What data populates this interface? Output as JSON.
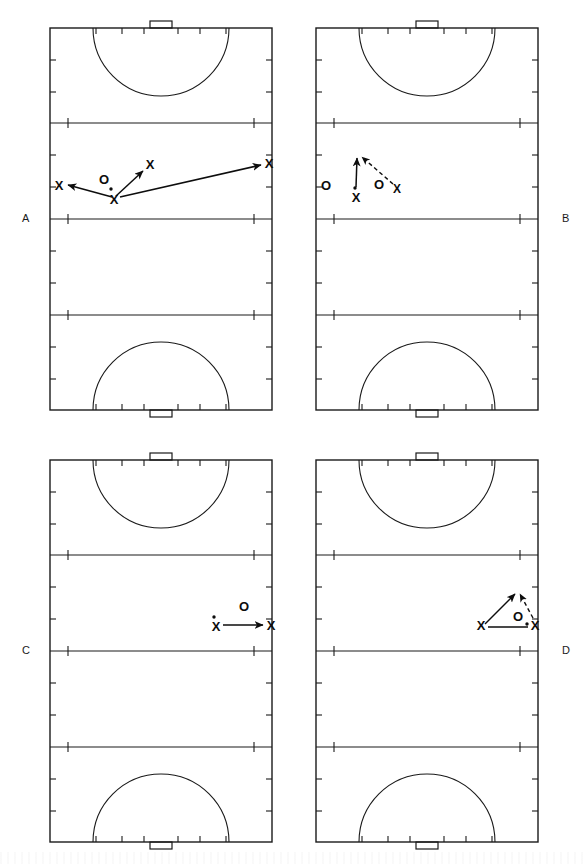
{
  "figure": {
    "panels": [
      {
        "id": "A",
        "label": "A",
        "label_side": "left",
        "markers": [
          {
            "name": "ball-carrier-x",
            "symbol": "X",
            "x": 114,
            "y": 200,
            "has_ball": true
          },
          {
            "name": "defender-o",
            "symbol": "O",
            "x": 104,
            "y": 182,
            "has_ball": false
          },
          {
            "name": "teammate-x-left",
            "symbol": "X",
            "x": 59,
            "y": 187,
            "has_ball": false
          },
          {
            "name": "teammate-x-upper",
            "symbol": "X",
            "x": 149,
            "y": 166,
            "has_ball": false
          },
          {
            "name": "teammate-x-right",
            "symbol": "X",
            "x": 269,
            "y": 165,
            "has_ball": false
          }
        ],
        "arrows": [
          {
            "name": "pass-left",
            "style": "solid",
            "x1": 112,
            "y1": 197,
            "x2": 66,
            "y2": 185
          },
          {
            "name": "pass-upper",
            "style": "solid",
            "x1": 116,
            "y1": 196,
            "x2": 142,
            "y2": 170
          },
          {
            "name": "pass-right",
            "style": "solid",
            "x1": 120,
            "y1": 197,
            "x2": 262,
            "y2": 165
          }
        ]
      },
      {
        "id": "B",
        "label": "B",
        "label_side": "right",
        "markers": [
          {
            "name": "wing-o-left",
            "symbol": "O",
            "x": 32,
            "y": 187,
            "has_ball": false
          },
          {
            "name": "ball-carrier-x",
            "symbol": "X",
            "x": 62,
            "y": 196,
            "has_ball": true
          },
          {
            "name": "defender-o",
            "symbol": "O",
            "x": 85,
            "y": 186,
            "has_ball": false
          },
          {
            "name": "teammate-x-right",
            "symbol": "X",
            "x": 102,
            "y": 190,
            "has_ball": false
          }
        ],
        "arrows": [
          {
            "name": "run-up",
            "style": "solid",
            "x1": 62,
            "y1": 186,
            "x2": 64,
            "y2": 155
          },
          {
            "name": "pass-diagonal",
            "style": "dashed",
            "x1": 98,
            "y1": 184,
            "x2": 68,
            "y2": 155
          }
        ]
      },
      {
        "id": "C",
        "label": "C",
        "label_side": "left",
        "markers": [
          {
            "name": "ball-carrier-x",
            "symbol": "X",
            "x": 216,
            "y": 196,
            "has_ball": true
          },
          {
            "name": "defender-o",
            "symbol": "O",
            "x": 244,
            "y": 176,
            "has_ball": false
          },
          {
            "name": "teammate-x-right",
            "symbol": "X",
            "x": 271,
            "y": 195,
            "has_ball": false
          }
        ],
        "arrows": [
          {
            "name": "pass-across",
            "style": "solid",
            "x1": 224,
            "y1": 193,
            "x2": 264,
            "y2": 193
          }
        ]
      },
      {
        "id": "D",
        "label": "D",
        "label_side": "right",
        "markers": [
          {
            "name": "teammate-x-left",
            "symbol": "X",
            "x": 216,
            "y": 197,
            "has_ball": false
          },
          {
            "name": "defender-o",
            "symbol": "O",
            "x": 252,
            "y": 186,
            "has_ball": false
          },
          {
            "name": "ball-carrier-x",
            "symbol": "X",
            "x": 271,
            "y": 196,
            "has_ball": true
          },
          {
            "name": "ball-dot",
            "symbol": ".",
            "x": 262,
            "y": 192,
            "has_ball": false
          }
        ],
        "arrows": [
          {
            "name": "run-diagonal",
            "style": "solid",
            "x1": 219,
            "y1": 191,
            "x2": 250,
            "y2": 160
          },
          {
            "name": "pass-diagonal",
            "style": "dashed",
            "x1": 268,
            "y1": 186,
            "x2": 254,
            "y2": 160
          },
          {
            "name": "pass-across",
            "style": "solid",
            "x1": 224,
            "y1": 194,
            "x2": 264,
            "y2": 194
          }
        ]
      }
    ],
    "field": {
      "name": "field-hockey-pitch",
      "left": 50,
      "top": 28,
      "width": 222,
      "height": 382,
      "lines": [
        {
          "name": "back-line-top",
          "y": 28
        },
        {
          "name": "twentyfive-yard-line-top",
          "y": 123
        },
        {
          "name": "center-line",
          "y": 219
        },
        {
          "name": "twentyfive-yard-line-bottom",
          "y": 315
        },
        {
          "name": "back-line-bottom",
          "y": 410
        }
      ],
      "goals": [
        {
          "name": "goal-top",
          "cx": 161,
          "y": 21,
          "width": 22,
          "height": 7
        },
        {
          "name": "goal-bottom",
          "cx": 161,
          "y": 410,
          "width": 22,
          "height": 7
        }
      ],
      "striking_circles": [
        {
          "name": "striking-circle-top",
          "cx": 161,
          "cy": 28,
          "radius": 68
        },
        {
          "name": "striking-circle-bottom",
          "cx": 161,
          "cy": 410,
          "radius": 68
        }
      ],
      "sideline_tick_count": 6,
      "backline_tick_count": 6
    },
    "legend": {
      "attacker_symbol": "X",
      "defender_symbol": "O",
      "ball_symbol": ".",
      "solid_line_meaning": "player movement / pass",
      "dashed_line_meaning": "ball path"
    },
    "colors": {
      "ink": "#1a1a1a",
      "background": "#ffffff",
      "mark": "#0d0d0d"
    }
  }
}
